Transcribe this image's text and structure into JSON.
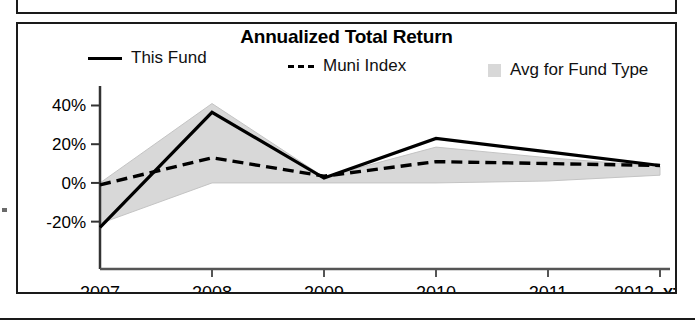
{
  "panel": {
    "title": "Annualized Total Return"
  },
  "legend": {
    "items": [
      {
        "label": "This Fund",
        "marker": "solid-line",
        "color": "#000000"
      },
      {
        "label": "Muni Index",
        "marker": "dashed-line",
        "color": "#000000"
      },
      {
        "label": "Avg for Fund Type",
        "marker": "shaded-area",
        "color": "#d8d8d8"
      }
    ]
  },
  "axis": {
    "y_ticks": [
      "40%",
      "20%",
      "0%",
      "-20%"
    ],
    "x_ticks": [
      "2007",
      "2008",
      "2009",
      "2010",
      "2011",
      "2012"
    ],
    "x_unit_label": "YTD"
  },
  "chart_data": {
    "type": "line",
    "title": "Annualized Total Return",
    "xlabel": "",
    "ylabel": "",
    "x": [
      "2007",
      "2008",
      "2009",
      "2010",
      "2011",
      "2012 YTD"
    ],
    "categories": [
      "2007",
      "2008",
      "2009",
      "2010",
      "2011",
      "2012 YTD"
    ],
    "ylim": [
      -30,
      48
    ],
    "y_ticks": [
      -20,
      0,
      20,
      40
    ],
    "y_tick_labels": [
      "-20%",
      "0%",
      "20%",
      "40%"
    ],
    "grid": false,
    "legend_position": "top",
    "series": [
      {
        "name": "This Fund",
        "style": "solid",
        "color": "#000000",
        "values": [
          -23,
          36.5,
          2.5,
          23,
          16,
          9
        ]
      },
      {
        "name": "Muni Index",
        "style": "dashed",
        "color": "#000000",
        "values": [
          -1,
          13,
          3.5,
          11,
          10,
          9
        ]
      },
      {
        "name": "Avg for Fund Type",
        "style": "area",
        "color": "#d8d8d8",
        "upper": [
          0,
          41,
          3,
          18.5,
          13,
          8.5
        ],
        "lower": [
          -21,
          0,
          0,
          0,
          1,
          4
        ]
      }
    ]
  }
}
